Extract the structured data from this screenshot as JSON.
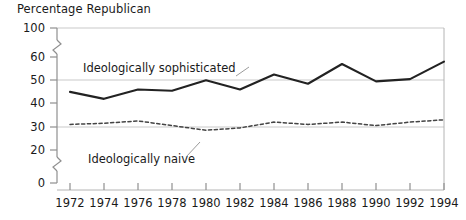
{
  "chart_data": {
    "type": "line",
    "title": "Percentage Republican",
    "xlabel": "",
    "ylabel": "",
    "grid": true,
    "grid_values": [
      100,
      50,
      30
    ],
    "legend_position": "inline-annotation",
    "axis_break": true,
    "axis_break_segments": [
      [
        0,
        20
      ],
      [
        60,
        100
      ]
    ],
    "ylim": [
      0,
      100
    ],
    "ytick_labels": [
      "100",
      "60",
      "50",
      "40",
      "30",
      "20",
      "0"
    ],
    "yticks": [
      100,
      60,
      50,
      40,
      30,
      20,
      0
    ],
    "categories": [
      1972,
      1974,
      1976,
      1978,
      1980,
      1982,
      1984,
      1986,
      1988,
      1990,
      1992,
      1994
    ],
    "xtick_labels": [
      "1972",
      "1974",
      "1976",
      "1978",
      "1980",
      "1982",
      "1984",
      "1986",
      "1988",
      "1990",
      "1992",
      "1994"
    ],
    "series": [
      {
        "name": "Ideologically sophisticated",
        "style": "solid",
        "color": "#222222",
        "values": [
          45,
          42,
          46,
          45.5,
          50,
          46,
          52.5,
          48.5,
          57,
          49.5,
          50.5,
          58
        ]
      },
      {
        "name": "Ideologically naive",
        "style": "dashed",
        "color": "#444444",
        "values": [
          31,
          31.5,
          32.5,
          30.5,
          28.5,
          29.5,
          32,
          31,
          32,
          30.5,
          32,
          33
        ]
      }
    ],
    "annotations": [
      {
        "text": "Ideologically sophisticated",
        "target_series": "Ideologically sophisticated"
      },
      {
        "text": "Ideologically naive",
        "target_series": "Ideologically naive"
      }
    ]
  },
  "colors": {
    "axis": "#9a9a9a",
    "grid": "#c8c8c8",
    "text": "#1a1a1a",
    "solid_line": "#222222",
    "dashed_line": "#444444",
    "background": "#ffffff"
  }
}
